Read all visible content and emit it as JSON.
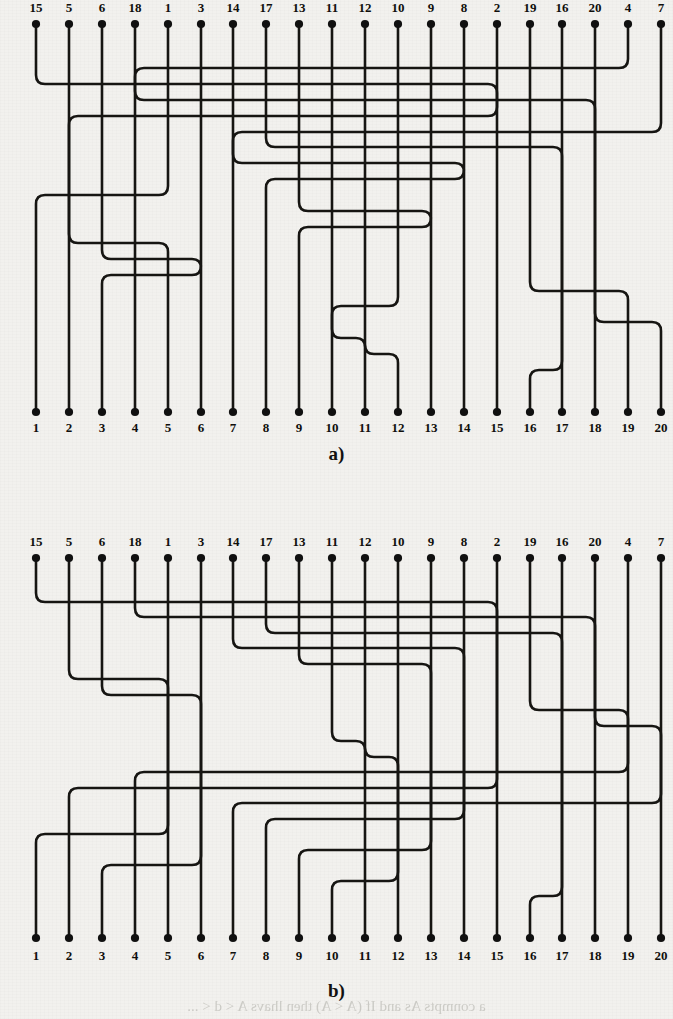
{
  "figure": {
    "type": "orthogonal-wire-routing-diagram",
    "panel_count": 2,
    "terminal_count": 20
  },
  "panel_a": {
    "caption": "a)",
    "top_labels": [
      "15",
      "5",
      "6",
      "18",
      "1",
      "3",
      "14",
      "17",
      "13",
      "11",
      "12",
      "10",
      "9",
      "8",
      "2",
      "19",
      "16",
      "20",
      "4",
      "7"
    ],
    "bottom_labels": [
      "1",
      "2",
      "3",
      "4",
      "5",
      "6",
      "7",
      "8",
      "9",
      "10",
      "11",
      "12",
      "13",
      "14",
      "15",
      "16",
      "17",
      "18",
      "19",
      "20"
    ]
  },
  "panel_b": {
    "caption": "b)",
    "top_labels": [
      "15",
      "5",
      "6",
      "18",
      "1",
      "3",
      "14",
      "17",
      "13",
      "11",
      "12",
      "10",
      "9",
      "8",
      "2",
      "19",
      "16",
      "20",
      "4",
      "7"
    ],
    "bottom_labels": [
      "1",
      "2",
      "3",
      "4",
      "5",
      "6",
      "7",
      "8",
      "9",
      "10",
      "11",
      "12",
      "13",
      "14",
      "15",
      "16",
      "17",
      "18",
      "19",
      "20"
    ]
  },
  "chart_data": {
    "type": "diagram",
    "title": "",
    "permutation_top_to_bottom": [
      15,
      5,
      6,
      18,
      1,
      3,
      14,
      17,
      13,
      11,
      12,
      10,
      9,
      8,
      2,
      19,
      16,
      20,
      4,
      7
    ],
    "terminals": 20,
    "panels": [
      {
        "label": "a)",
        "top": [
          15,
          5,
          6,
          18,
          1,
          3,
          14,
          17,
          13,
          11,
          12,
          10,
          9,
          8,
          2,
          19,
          16,
          20,
          4,
          7
        ],
        "bottom": [
          1,
          2,
          3,
          4,
          5,
          6,
          7,
          8,
          9,
          10,
          11,
          12,
          13,
          14,
          15,
          16,
          17,
          18,
          19,
          20
        ]
      },
      {
        "label": "b)",
        "top": [
          15,
          5,
          6,
          18,
          1,
          3,
          14,
          17,
          13,
          11,
          12,
          10,
          9,
          8,
          2,
          19,
          16,
          20,
          4,
          7
        ],
        "bottom": [
          1,
          2,
          3,
          4,
          5,
          6,
          7,
          8,
          9,
          10,
          11,
          12,
          13,
          14,
          15,
          16,
          17,
          18,
          19,
          20
        ]
      }
    ]
  },
  "bleed_text": "a conmpts As and If (A < A) then lhavs A < d < ... "
}
